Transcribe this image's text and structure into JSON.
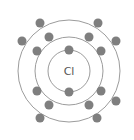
{
  "diagram": {
    "element_symbol": "Cl",
    "center": [
      69,
      71
    ],
    "colors": {
      "ring": "#9c9c9c",
      "electron": "#7f7f7f",
      "label": "#555555",
      "background": "#ffffff"
    },
    "electron_radius": 4.5,
    "shells": [
      {
        "name": "shell-1",
        "radius": 21,
        "electron_count": 2,
        "electrons": [
          [
            69,
            50
          ],
          [
            69,
            92
          ]
        ]
      },
      {
        "name": "shell-2",
        "radius": 34,
        "electron_count": 8,
        "electrons": [
          [
            49,
            37
          ],
          [
            89,
            37
          ],
          [
            37,
            51
          ],
          [
            101,
            51
          ],
          [
            37,
            91
          ],
          [
            101,
            91
          ],
          [
            49,
            105
          ],
          [
            89,
            105
          ]
        ]
      },
      {
        "name": "shell-3",
        "radius": 51,
        "electron_count": 7,
        "electrons": [
          [
            40,
            23
          ],
          [
            98,
            23
          ],
          [
            22,
            41
          ],
          [
            116,
            41
          ],
          [
            116,
            101
          ],
          [
            40,
            118
          ],
          [
            97,
            118
          ]
        ]
      }
    ]
  }
}
